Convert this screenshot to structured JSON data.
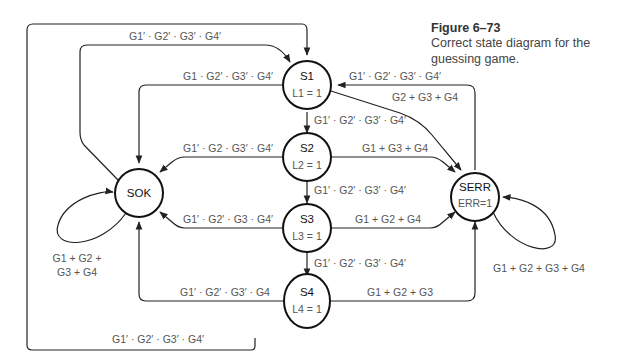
{
  "caption": {
    "title": "Figure  6–73",
    "text": "Correct state diagram for the guessing game."
  },
  "states": {
    "S1": {
      "name": "S1",
      "output": "L1 = 1"
    },
    "S2": {
      "name": "S2",
      "output": "L2 = 1"
    },
    "S3": {
      "name": "S3",
      "output": "L3 = 1"
    },
    "S4": {
      "name": "S4",
      "output": "L4 = 1"
    },
    "SOK": {
      "name": "SOK"
    },
    "SERR": {
      "name": "SERR",
      "output": "ERR=1"
    }
  },
  "transitions": {
    "sok_to_s1": "G1′ · G2′ · G3′ · G4′",
    "s1_to_sok": "G1 · G2′ · G3′ · G4′",
    "serr_to_s1": "G1′ · G2′ · G3′ · G4′",
    "s1_to_serr": "G2 + G3 + G4",
    "s1_to_s2": "G1′ · G2′ · G3′ · G4′",
    "s2_to_sok": "G1′ · G2 · G3′ · G4′",
    "s2_to_serr": "G1 + G3 + G4",
    "s2_to_s3": "G1′ · G2′ · G3′ · G4′",
    "s3_to_sok": "G1′ · G2′ · G3 · G4′",
    "s3_to_serr": "G1 + G2 + G4",
    "s3_to_s4": "G1′ · G2′ · G3′ · G4′",
    "s4_to_sok": "G1′ · G2′ · G3′ · G4",
    "s4_to_serr": "G1 + G2 + G3",
    "s4_to_s1": "G1′ · G2′ · G3′ · G4′",
    "sok_self_line1": "G1 + G2 +",
    "sok_self_line2": "G3 + G4",
    "serr_self": "G1 + G2 + G3 + G4"
  }
}
